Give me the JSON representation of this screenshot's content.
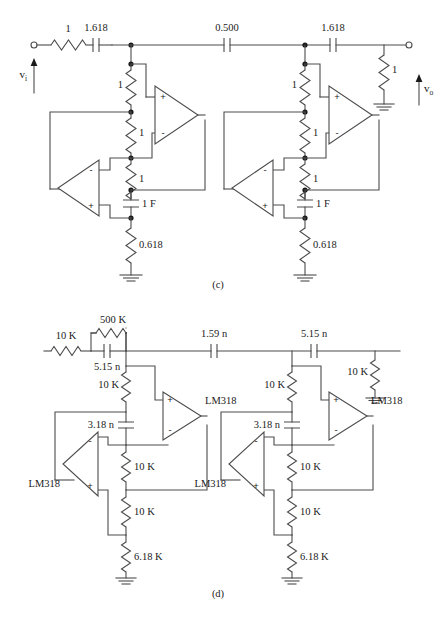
{
  "figure": {
    "panels": [
      {
        "id": "c",
        "caption": "(c)",
        "kind": "normalized-prototype",
        "ports": {
          "input_label": "v",
          "input_sub": "i",
          "output_label": "v",
          "output_sub": "o"
        },
        "ladder": {
          "source_resistor": "1",
          "series_caps": [
            "1.618",
            "0.500",
            "1.618"
          ],
          "load_resistor": "1"
        },
        "sections": [
          {
            "name": "section-1",
            "upper_resistor": "1",
            "mid_resistor": "1",
            "lower_resistor": "1",
            "capacitor": "1 F",
            "tail_resistor": "0.618",
            "opamp_top_signs": [
              "+",
              "-"
            ],
            "opamp_bottom_signs": [
              "-",
              "+"
            ]
          },
          {
            "name": "section-2",
            "upper_resistor": "1",
            "mid_resistor": "1",
            "lower_resistor": "1",
            "capacitor": "1 F",
            "tail_resistor": "0.618",
            "opamp_top_signs": [
              "+",
              "-"
            ],
            "opamp_bottom_signs": [
              "-",
              "+"
            ]
          }
        ]
      },
      {
        "id": "d",
        "caption": "(d)",
        "kind": "denormalized-realization",
        "ladder": {
          "source_resistor": "10 K",
          "parallel_resistor": "500 K",
          "parallel_capacitor": "5.15 n",
          "series_caps": [
            "1.59 n",
            "5.15 n"
          ],
          "load_resistor": "10 K"
        },
        "sections": [
          {
            "name": "section-1",
            "upper_resistor": "10 K",
            "capacitor_shunt": "3.18 n",
            "mid_resistor": "10 K",
            "lower_resistor": "10 K",
            "tail_resistor": "6.18 K",
            "opamp_left_label": "LM318",
            "opamp_right_label": "LM318",
            "opamp_right_signs": [
              "+",
              "-"
            ],
            "opamp_left_signs": [
              "-",
              "+"
            ]
          },
          {
            "name": "section-2",
            "upper_resistor": "10 K",
            "capacitor_shunt": "3.18 n",
            "mid_resistor": "10 K",
            "lower_resistor": "10 K",
            "tail_resistor": "6.18 K",
            "opamp_left_label": "LM318",
            "opamp_right_label": "LM318",
            "opamp_right_signs": [
              "+",
              "-"
            ],
            "opamp_left_signs": [
              "-",
              "+"
            ]
          }
        ]
      }
    ]
  },
  "colors": {
    "wire": "#4c4c4c",
    "text": "#1a1a1a",
    "background": "#ffffff"
  }
}
